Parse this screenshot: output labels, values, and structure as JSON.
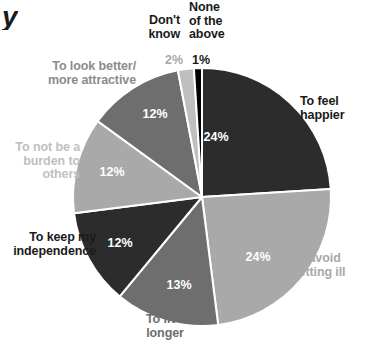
{
  "title_fragment": "y",
  "chart_data": {
    "type": "pie",
    "title": "",
    "subtitle": "",
    "xlabel": "",
    "ylabel": "",
    "legend_position": "callout-labels",
    "grid": false,
    "start_angle_deg": 0,
    "direction": "clockwise",
    "units": "%",
    "categories": [
      "To feel happier",
      "To avoid getting ill",
      "To live longer",
      "To keep my independence",
      "To not be a burden to others",
      "To look better/ more attractive",
      "Don't know",
      "None of the above"
    ],
    "values": [
      24,
      24,
      13,
      12,
      12,
      12,
      2,
      1
    ],
    "value_labels": [
      "24%",
      "24%",
      "13%",
      "12%",
      "12%",
      "12%",
      "2%",
      "1%"
    ],
    "colors": [
      "#2c2c2c",
      "#a9a9a9",
      "#6e6e6e",
      "#2c2c2c",
      "#a9a9a9",
      "#6e6e6e",
      "#bfbfbf",
      "#000000"
    ],
    "slice_label_color": [
      "#ffffff",
      "#ffffff",
      "#ffffff",
      "#ffffff",
      "#ffffff",
      "#ffffff",
      "#a9a9a9",
      "#1a1a1a"
    ],
    "callout_label_colors": [
      "#1a1a1a",
      "#a9a9a9",
      "#6e6e6e",
      "#1a1a1a",
      "#bfbfbf",
      "#8c8c8c",
      "#1a1a1a",
      "#1a1a1a"
    ]
  },
  "labels": {
    "feel_happier": "To feel\nhappier",
    "avoid_getting_ill": "To avoid\ngetting ill",
    "live_longer": "To live\nlonger",
    "keep_independence": "To keep my\nindependence",
    "not_be_burden": "To not be a\nburden to\nothers",
    "look_better": "To look better/\nmore attractive",
    "dont_know": "Don't\nknow",
    "none_of_above": "None\nof the\nabove"
  },
  "percent_labels": {
    "feel_happier": "24%",
    "avoid_getting_ill": "24%",
    "live_longer": "13%",
    "keep_independence": "12%",
    "not_be_burden": "12%",
    "look_better": "12%",
    "dont_know": "2%",
    "none_of_above": "1%"
  }
}
